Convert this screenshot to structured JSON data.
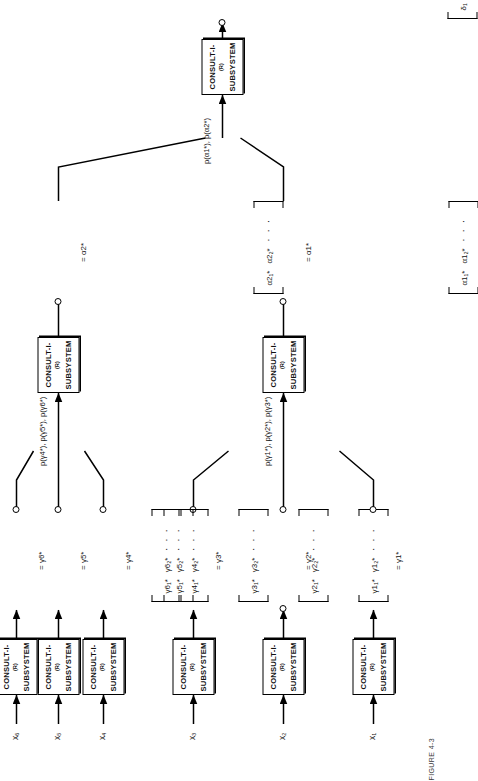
{
  "figure": {
    "caption": "FIGURE 4-3",
    "background_color": "#ffffff",
    "ink_color": "#000000"
  },
  "subsystem": {
    "line1": "CONSULT-I",
    "superscript": "(R)",
    "line2": "SUBSYSTEM"
  },
  "glyphs": {
    "ellipsis": "· · ·",
    "equals": "=",
    "bracket_open": "[",
    "bracket_close": "]"
  },
  "leaf_subsystems": [
    {
      "id": "leaf-1",
      "input_label": "x₁",
      "box_label": "CONSULT-I(R) SUBSYSTEM"
    },
    {
      "id": "leaf-2",
      "input_label": "x₂",
      "box_label": "CONSULT-I(R) SUBSYSTEM"
    },
    {
      "id": "leaf-3",
      "input_label": "x₃",
      "box_label": "CONSULT-I(R) SUBSYSTEM"
    },
    {
      "id": "leaf-4",
      "input_label": "x₄",
      "box_label": "CONSULT-I(R) SUBSYSTEM"
    },
    {
      "id": "leaf-5",
      "input_label": "x₅",
      "box_label": "CONSULT-I(R) SUBSYSTEM"
    },
    {
      "id": "leaf-6",
      "input_label": "x₆",
      "box_label": "CONSULT-I(R) SUBSYSTEM"
    }
  ],
  "gamma_vectors": [
    {
      "id": "gamma-1",
      "cell1": "γ1₁*",
      "cell2": "γ1₂*",
      "dots": "· · ·",
      "eq_label": "= γ1*"
    },
    {
      "id": "gamma-2",
      "cell1": "γ2₁*",
      "cell2": "γ2₂*",
      "dots": "· · ·",
      "eq_label": "= γ2*"
    },
    {
      "id": "gamma-3",
      "cell1": "γ3₁*",
      "cell2": "γ3₂*",
      "dots": "· · ·",
      "eq_label": "= γ3*"
    },
    {
      "id": "gamma-4",
      "cell1": "γ4₁*",
      "cell2": "γ4₂*",
      "dots": "· · ·",
      "eq_label": "= γ4*"
    },
    {
      "id": "gamma-5",
      "cell1": "γ5₁*",
      "cell2": "γ5₂*",
      "dots": "· · ·",
      "eq_label": "= γ5*"
    },
    {
      "id": "gamma-6",
      "cell1": "γ6₁*",
      "cell2": "γ6₂*",
      "dots": "· · ·",
      "eq_label": "= γ6*"
    }
  ],
  "mid_subsystems": [
    {
      "id": "mid-1",
      "box_label": "CONSULT-I(R) SUBSYSTEM",
      "edge_label": "p(γ1*), p(γ2*), p(γ3*)"
    },
    {
      "id": "mid-2",
      "box_label": "CONSULT-I(R) SUBSYSTEM",
      "edge_label": "p(γ4*), p(γ5*), p(γ6*)"
    }
  ],
  "alpha_vectors": [
    {
      "id": "alpha-1",
      "cell1": "α1₁*",
      "cell2": "α1₂*",
      "dots": "· · ·",
      "eq_label": "= α1*"
    },
    {
      "id": "alpha-2",
      "cell1": "α2₁*",
      "cell2": "α2₂*",
      "dots": "· · ·",
      "eq_label": "= α2*"
    }
  ],
  "root": {
    "box_label": "CONSULT-I(R) SUBSYSTEM",
    "edge_label": "p(α1*), p(α2*)",
    "output_vector": {
      "id": "delta",
      "cell1": "δ₁",
      "cell2": "δ₂",
      "dots": "· · ·",
      "eq_label": "= δ"
    }
  }
}
